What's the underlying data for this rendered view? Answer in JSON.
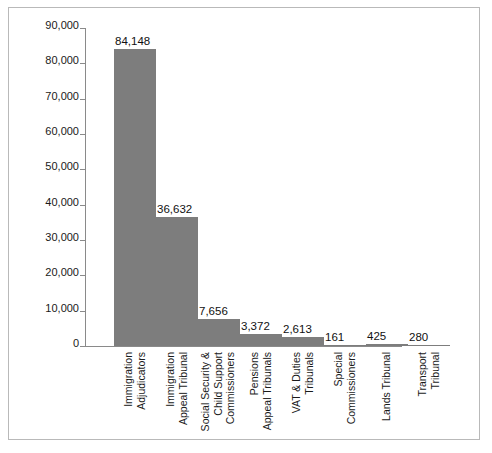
{
  "chart_data": {
    "type": "bar",
    "title": "",
    "xlabel": "",
    "ylabel": "",
    "ylim": [
      0,
      90000
    ],
    "grid": false,
    "legend": "none",
    "bar_color": "#7d7d7d",
    "axis_color": "#8a8a8a",
    "border_color": "#b9b9b9",
    "background": "#ffffff",
    "y_ticks": [
      {
        "value": 90000,
        "label": "90,000"
      },
      {
        "value": 80000,
        "label": "80,000"
      },
      {
        "value": 70000,
        "label": "70,000"
      },
      {
        "value": 60000,
        "label": "60,000"
      },
      {
        "value": 50000,
        "label": "50,000"
      },
      {
        "value": 40000,
        "label": "40,000"
      },
      {
        "value": 30000,
        "label": "30,000"
      },
      {
        "value": 20000,
        "label": "20,000"
      },
      {
        "value": 10000,
        "label": "10,000"
      },
      {
        "value": 0,
        "label": "0"
      }
    ],
    "categories": [
      "Immigration Adjudicators",
      "Immigration Appeal Tribunal",
      "Social Security & Child Support Commissioners",
      "Pensions Appeal Tribunals",
      "VAT & Duties Tribunals",
      "Special Commissioners",
      "Lands Tribunal",
      "Transport Tribunal"
    ],
    "category_lines": [
      {
        "line1": "Immigration",
        "line2": "Adjudicators"
      },
      {
        "line1": "Immigration",
        "line2": "Appeal Tribunal"
      },
      {
        "line1": "Social Security &",
        "line2": "Child Support",
        "line3": "Commissioners"
      },
      {
        "line1": "Pensions",
        "line2": "Appeal Tribunals"
      },
      {
        "line1": "VAT & Duties",
        "line2": "Tribunals"
      },
      {
        "line1": "Special",
        "line2": "Commissioners"
      },
      {
        "line1": "Lands Tribunal",
        "line2": ""
      },
      {
        "line1": "Transport",
        "line2": "Tribunal"
      }
    ],
    "values": [
      84148,
      36632,
      7656,
      3372,
      2613,
      161,
      425,
      280
    ],
    "value_labels": [
      "84,148",
      "36,632",
      "7,656",
      "3,372",
      "2,613",
      "161",
      "425",
      "280"
    ]
  }
}
